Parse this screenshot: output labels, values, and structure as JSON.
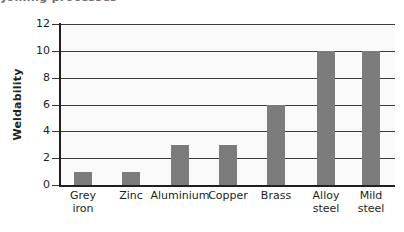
{
  "figure": {
    "clipped_header_text": "Joining processes",
    "background_color": "#ffffff",
    "plot_background_color": "#fafafa",
    "bar_color": "#7c7c7c",
    "axis_color": "#231f20",
    "gridline_color": "#3a3a3a"
  },
  "chart_data": {
    "type": "bar",
    "title": "",
    "xlabel": "",
    "ylabel": "Weldability",
    "categories": [
      "Grey\niron",
      "Zinc",
      "Aluminium",
      "Copper",
      "Brass",
      "Alloy\nsteel",
      "Mild\nsteel"
    ],
    "values": [
      1,
      1,
      3,
      3,
      6,
      10,
      10
    ],
    "ylim": [
      0,
      12
    ],
    "yticks": [
      0,
      2,
      4,
      6,
      8,
      10,
      12
    ],
    "ytick_labels": [
      "0",
      "2",
      "4",
      "6",
      "8",
      "10",
      "12"
    ],
    "grid": "horizontal",
    "legend": "none",
    "orientation": "vertical"
  }
}
